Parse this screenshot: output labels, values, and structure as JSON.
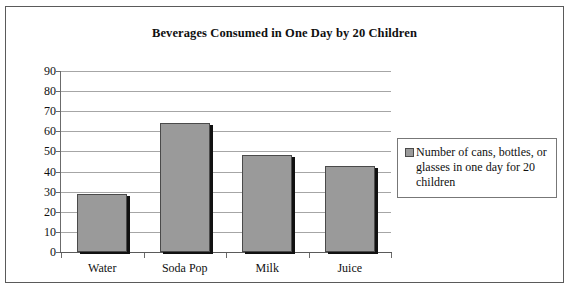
{
  "chart_data": {
    "type": "bar",
    "title": "Beverages Consumed in One Day by 20 Children",
    "categories": [
      "Water",
      "Soda Pop",
      "Milk",
      "Juice"
    ],
    "values": [
      29,
      64,
      48,
      43
    ],
    "series": [
      {
        "name": "Number of cans, bottles, or glasses in one day for 20 children",
        "values": [
          29,
          64,
          48,
          43
        ]
      }
    ],
    "xlabel": "",
    "ylabel": "",
    "ylim": [
      0,
      90
    ],
    "ytick_labels": [
      "90",
      "80",
      "70",
      "60",
      "50",
      "40",
      "30",
      "20",
      "10",
      "0"
    ],
    "ytick_values": [
      90,
      80,
      70,
      60,
      50,
      40,
      30,
      20,
      10,
      0
    ],
    "grid": true,
    "legend_position": "right",
    "colors": {
      "bar_fill": "#9a9a9a",
      "bar_outline": "#4a4a4a",
      "bar_shadow": "#111111",
      "gridline": "#a6a6a6",
      "axis": "#5a5a5a",
      "frame": "#5a5a5a",
      "text": "#101010",
      "background": "#ffffff"
    }
  },
  "legend": {
    "entries": [
      {
        "label": "Number of cans, bottles, or glasses in one day for 20 children"
      }
    ]
  }
}
